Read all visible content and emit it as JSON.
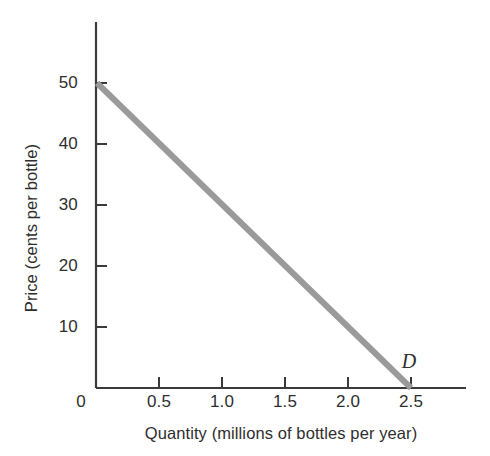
{
  "figure": {
    "background_color": "#ffffff",
    "axis_color": "#3a3a3a",
    "curve_color": "#9a9a9a",
    "text_color": "#2e2e2e"
  },
  "chart_data": {
    "type": "line",
    "title": "",
    "subtitle": "",
    "xlabel": "Quantity (millions of bottles per year)",
    "ylabel": "Price (cents per bottle)",
    "xlim": [
      0,
      2.75
    ],
    "ylim": [
      0,
      55
    ],
    "grid": false,
    "legend": "none",
    "x_ticks": [
      0,
      0.5,
      1.0,
      1.5,
      2.0,
      2.5
    ],
    "x_tick_labels": [
      "0",
      "0.5",
      "1.0",
      "1.5",
      "2.0",
      "2.5"
    ],
    "y_ticks": [
      0,
      10,
      20,
      30,
      40,
      50
    ],
    "y_tick_labels": [
      "0",
      "10",
      "20",
      "30",
      "40",
      "50"
    ],
    "origin_label": "0",
    "series": [
      {
        "name": "D",
        "label": "D",
        "kind": "demand-curve",
        "color": "#9a9a9a",
        "line_width": 6,
        "x": [
          0,
          2.5
        ],
        "y": [
          50,
          0
        ],
        "points": [
          {
            "x": 0,
            "y": 50
          },
          {
            "x": 0.5,
            "y": 40
          },
          {
            "x": 1.0,
            "y": 30
          },
          {
            "x": 1.5,
            "y": 20
          },
          {
            "x": 2.0,
            "y": 10
          },
          {
            "x": 2.5,
            "y": 0
          }
        ]
      }
    ],
    "annotations": [
      {
        "text": "D",
        "x": 2.5,
        "y": 3,
        "style": "italic"
      }
    ]
  }
}
